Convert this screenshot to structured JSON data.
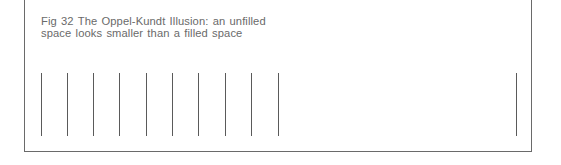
{
  "figure": {
    "caption_line1": "Fig 32  The Oppel-Kundt Illusion: an unfilled",
    "caption_line2": "space looks smaller than a filled space",
    "line_color": "#5a5a5a",
    "border_color": "#6a6a6a",
    "filled_space": {
      "line_count": 10,
      "line_x_positions": [
        41,
        67,
        93,
        119,
        146,
        172,
        198,
        225,
        251,
        278
      ]
    },
    "unfilled_space": {
      "line_count": 1,
      "line_x_positions": [
        516
      ]
    },
    "line_top": 73,
    "line_height": 63
  }
}
